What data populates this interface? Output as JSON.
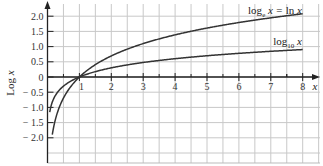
{
  "chart_data": {
    "type": "line",
    "title": "",
    "xlabel": "x",
    "ylabel": "Log x",
    "xlim": [
      0,
      8.5
    ],
    "ylim": [
      -2.5,
      2.4
    ],
    "grid": true,
    "x_ticks": [
      "1",
      "2",
      "3",
      "4",
      "5",
      "6",
      "7",
      "8"
    ],
    "y_ticks": [
      "2.0",
      "1.5",
      "1.0",
      "0.5",
      "0",
      "-0.5",
      "-1.0",
      "-1.5",
      "-2.0"
    ],
    "series": [
      {
        "name": "log_e x = ln x",
        "label_main": "log",
        "label_sub": "e",
        "label_rest": " x = ln x",
        "x": [
          0.15,
          0.25,
          0.5,
          1,
          2,
          3,
          4,
          5,
          6,
          7,
          8
        ],
        "y": [
          -1.9,
          -1.39,
          -0.69,
          0,
          0.69,
          1.1,
          1.39,
          1.61,
          1.79,
          1.95,
          2.08
        ]
      },
      {
        "name": "log_10 x",
        "label_main": "log",
        "label_sub": "10",
        "label_rest": " x",
        "x": [
          0.07,
          0.15,
          0.25,
          0.5,
          1,
          2,
          3,
          4,
          5,
          6,
          7,
          8
        ],
        "y": [
          -1.15,
          -0.82,
          -0.6,
          -0.3,
          0,
          0.3,
          0.48,
          0.6,
          0.7,
          0.78,
          0.85,
          0.9
        ]
      }
    ],
    "legend_position": "inline labels at right end of curves"
  }
}
